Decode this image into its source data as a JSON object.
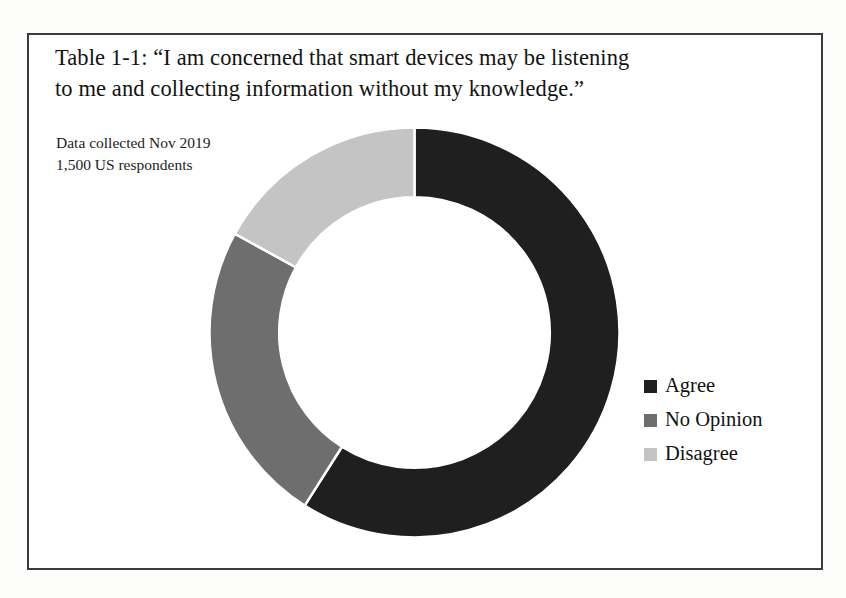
{
  "figure": {
    "caption_line_1": "Table 1-1: “I am concerned that smart devices may be listening",
    "caption_line_2": "to me and collecting information without my knowledge.”",
    "note_line_1": "Data collected Nov 2019",
    "note_line_2": "1,500 US respondents",
    "border_color": "#3b3b3b",
    "background_color": "#ffffff"
  },
  "chart_data": {
    "type": "pie",
    "variant": "donut",
    "title": "Table 1-1: “I am concerned that smart devices may be listening to me and collecting information without my knowledge.”",
    "subtitle": "Data collected Nov 2019 / 1,500 US respondents",
    "xlabel": "",
    "ylabel": "",
    "grid": false,
    "legend_position": "right",
    "start_angle_deg": 0,
    "direction": "clockwise",
    "inner_radius_ratio": 0.66,
    "categories": [
      "Agree",
      "No Opinion",
      "Disagree"
    ],
    "values": [
      59,
      24,
      17
    ],
    "value_unit": "percent",
    "colors": [
      "#1f1f1f",
      "#6e6e6e",
      "#c4c4c4"
    ],
    "slices": [
      {
        "label": "Agree",
        "value": 59,
        "color": "#1f1f1f",
        "start_deg": 0,
        "end_deg": 212.4
      },
      {
        "label": "No Opinion",
        "value": 24,
        "color": "#6e6e6e",
        "start_deg": 212.4,
        "end_deg": 298.8
      },
      {
        "label": "Disagree",
        "value": 17,
        "color": "#c4c4c4",
        "start_deg": 298.8,
        "end_deg": 360
      }
    ]
  },
  "legend": {
    "items": [
      {
        "label": "Agree",
        "color": "#1f1f1f"
      },
      {
        "label": "No Opinion",
        "color": "#6e6e6e"
      },
      {
        "label": "Disagree",
        "color": "#c4c4c4"
      }
    ]
  }
}
